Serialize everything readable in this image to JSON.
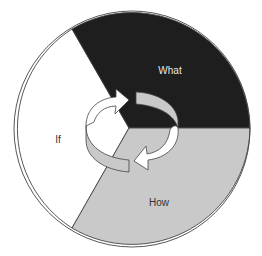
{
  "diagram": {
    "type": "cycle-pie",
    "segments": [
      {
        "id": "what",
        "label": "What",
        "fill": "#1e1e1e",
        "text_color": "#e6e6e6"
      },
      {
        "id": "how",
        "label": "How",
        "fill": "#c9c9c9",
        "text_color": "#333333"
      },
      {
        "id": "if",
        "label": "If",
        "fill": "#ffffff",
        "text_color": "#333333"
      }
    ],
    "center_icon": "circular-arrows-icon",
    "colors": {
      "outline": "#444444",
      "arrow_white": "#ffffff",
      "arrow_grey": "#c9c9c9"
    }
  }
}
